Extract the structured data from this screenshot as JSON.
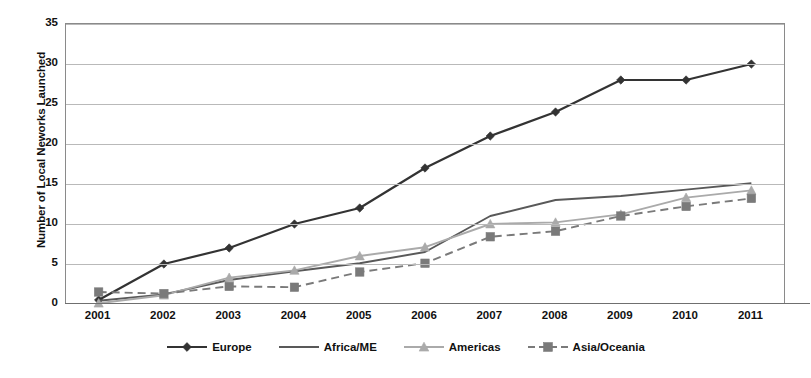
{
  "chart_data": {
    "type": "line",
    "title": "",
    "xlabel": "",
    "ylabel": "Number of Local Neworks Launched",
    "categories": [
      "2001",
      "2002",
      "2003",
      "2004",
      "2005",
      "2006",
      "2007",
      "2008",
      "2009",
      "2010",
      "2011"
    ],
    "x": [
      2001,
      2002,
      2003,
      2004,
      2005,
      2006,
      2007,
      2008,
      2009,
      2010,
      2011
    ],
    "ylim": [
      0,
      35
    ],
    "yticks": [
      0,
      5,
      10,
      15,
      20,
      25,
      30,
      35
    ],
    "ytick_labels": [
      "0",
      "5",
      "10",
      "15",
      "20",
      "25",
      "30",
      "35"
    ],
    "grid": true,
    "legend_position": "bottom",
    "series": [
      {
        "name": "Europe",
        "color": "#333333",
        "marker": "diamond",
        "dash": "solid",
        "values": [
          0.5,
          5,
          7,
          10,
          12,
          17,
          21,
          24,
          28,
          28,
          30
        ]
      },
      {
        "name": "Africa/ME",
        "color": "#595959",
        "marker": "none",
        "dash": "solid",
        "values": [
          0.4,
          1.2,
          3.0,
          4.1,
          5.1,
          6.5,
          11.0,
          13.0,
          13.5,
          14.3,
          15.1
        ]
      },
      {
        "name": "Americas",
        "color": "#aaaaaa",
        "marker": "triangle",
        "dash": "solid",
        "values": [
          0.1,
          1.1,
          3.3,
          4.2,
          6.0,
          7.1,
          10.0,
          10.2,
          11.2,
          13.3,
          14.2
        ]
      },
      {
        "name": "Asia/Oceania",
        "color": "#7a7a7a",
        "marker": "square",
        "dash": "dashed",
        "values": [
          1.5,
          1.3,
          2.2,
          2.1,
          4.0,
          5.1,
          8.4,
          9.1,
          11.0,
          12.2,
          13.2
        ]
      }
    ]
  },
  "legend": {
    "items": [
      {
        "label": "Europe"
      },
      {
        "label": "Africa/ME"
      },
      {
        "label": "Americas"
      },
      {
        "label": "Asia/Oceania"
      }
    ]
  }
}
